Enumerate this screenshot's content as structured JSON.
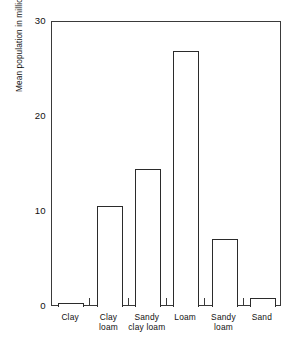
{
  "chart_data": {
    "type": "bar",
    "title": "",
    "subtitle": "",
    "xlabel": "",
    "ylabel": "Mean population in millions/acre",
    "categories": [
      "Clay",
      "Clay loam",
      "Sandy clay loam",
      "Loam",
      "Sandy loam",
      "Sand"
    ],
    "category_lines": [
      [
        "Clay"
      ],
      [
        "Clay",
        "loam"
      ],
      [
        "Sandy",
        "clay loam"
      ],
      [
        "Loam"
      ],
      [
        "Sandy",
        "loam"
      ],
      [
        "Sand"
      ]
    ],
    "values": [
      0.4,
      10.6,
      14.5,
      27.0,
      7.2,
      1.0
    ],
    "ylim": [
      0,
      30
    ],
    "xlim_note": "categorical",
    "yticks": [
      0,
      10,
      20,
      30
    ],
    "ytick_labels": [
      "0",
      "10",
      "20",
      "30"
    ],
    "grid": false,
    "legend": null,
    "legend_position": "none",
    "bar_style": {
      "fill": "#ffffff",
      "edge": "#2b2b2b",
      "edge_width": 1.3
    },
    "frame_color": "#3a3a3a",
    "background": "#ffffff",
    "text_color": "#111111"
  }
}
